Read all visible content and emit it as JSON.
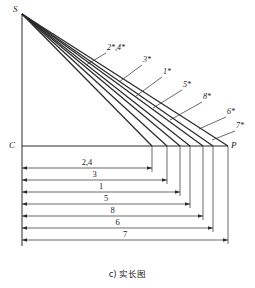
{
  "figure": {
    "caption": "c) 实长图",
    "points": {
      "apex": "S",
      "base_left": "C",
      "base_right": "P"
    },
    "ray_labels": [
      {
        "text": "2*,4*",
        "x": 107,
        "y": 50,
        "lead_from_x": 106,
        "lead_from_y": 53,
        "lead_to_x": 86,
        "lead_to_y": 65
      },
      {
        "text": "3*",
        "x": 143,
        "y": 62,
        "lead_from_x": 142,
        "lead_from_y": 65,
        "lead_to_x": 119,
        "lead_to_y": 82
      },
      {
        "text": "1*",
        "x": 163,
        "y": 74,
        "lead_from_x": 162,
        "lead_from_y": 77,
        "lead_to_x": 136,
        "lead_to_y": 96
      },
      {
        "text": "5*",
        "x": 183,
        "y": 87,
        "lead_from_x": 182,
        "lead_from_y": 90,
        "lead_to_x": 153,
        "lead_to_y": 108
      },
      {
        "text": "8*",
        "x": 203,
        "y": 99,
        "lead_from_x": 202,
        "lead_from_y": 102,
        "lead_to_x": 170,
        "lead_to_y": 120
      },
      {
        "text": "6*",
        "x": 227,
        "y": 114,
        "lead_from_x": 226,
        "lead_from_y": 117,
        "lead_to_x": 199,
        "lead_to_y": 129
      },
      {
        "text": "7*",
        "x": 236,
        "y": 128,
        "lead_from_x": 235,
        "lead_from_y": 131,
        "lead_to_x": 212,
        "lead_to_y": 140
      }
    ],
    "dimensions": [
      {
        "label": "2,4",
        "y": 168,
        "end_x": 152,
        "drop_x": 152
      },
      {
        "label": "3",
        "y": 180,
        "end_x": 167,
        "drop_x": 167
      },
      {
        "label": "1",
        "y": 192,
        "end_x": 180,
        "drop_x": 180
      },
      {
        "label": "5",
        "y": 204,
        "end_x": 190,
        "drop_x": 190
      },
      {
        "label": "8",
        "y": 216,
        "end_x": 203,
        "drop_x": 203
      },
      {
        "label": "6",
        "y": 228,
        "end_x": 213,
        "drop_x": 213
      },
      {
        "label": "7",
        "y": 240,
        "end_x": 228,
        "drop_x": 228
      }
    ],
    "geometry": {
      "apex_x": 22,
      "apex_y": 14,
      "baseline_y": 146,
      "baseline_left_x": 22,
      "baseline_right_x": 228,
      "dim_left_x": 22
    },
    "colors": {
      "ink": "#2b2b2b",
      "paper": "#ffffff"
    }
  }
}
